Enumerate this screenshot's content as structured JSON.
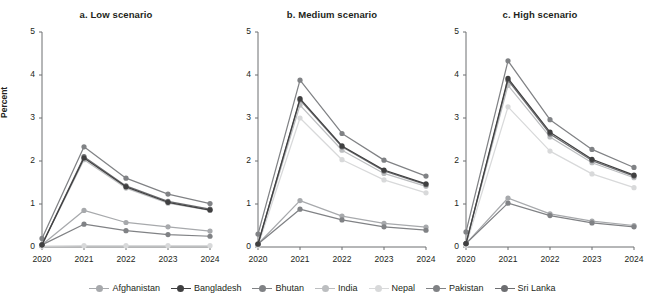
{
  "figure": {
    "ylabel": "Percent",
    "legend_position": "bottom"
  },
  "chart_data": {
    "type": "line",
    "title": "",
    "xlabel": "",
    "ylabel": "Percent",
    "x": [
      "2020",
      "2021",
      "2022",
      "2023",
      "2024"
    ],
    "ylim": [
      0,
      5
    ],
    "yticks": [
      0,
      1,
      2,
      3,
      4,
      5
    ],
    "grid": false,
    "legend": [
      "Afghanistan",
      "Bangladesh",
      "Bhutan",
      "India",
      "Nepal",
      "Pakistan",
      "Sri Lanka"
    ],
    "colors": {
      "Afghanistan": "#a7a9ac",
      "Bangladesh": "#404041",
      "Bhutan": "#808285",
      "India": "#bcbec0",
      "Nepal": "#d8d9da",
      "Pakistan": "#808285",
      "Sri Lanka": "#6d6e71"
    },
    "panels": [
      {
        "key": "low",
        "title": "a. Low scenario",
        "series": [
          {
            "name": "Afghanistan",
            "values": [
              0.05,
              0.85,
              0.57,
              0.47,
              0.37
            ]
          },
          {
            "name": "Bangladesh",
            "values": [
              0.05,
              2.07,
              1.4,
              1.04,
              0.86
            ]
          },
          {
            "name": "Bhutan",
            "values": [
              0.2,
              2.33,
              1.6,
              1.23,
              1.01
            ]
          },
          {
            "name": "India",
            "values": [
              0.05,
              2.03,
              1.37,
              1.02,
              0.85
            ]
          },
          {
            "name": "Nepal",
            "values": [
              0.02,
              0.03,
              0.03,
              0.03,
              0.03
            ]
          },
          {
            "name": "Pakistan",
            "values": [
              0.05,
              0.53,
              0.38,
              0.29,
              0.25
            ]
          },
          {
            "name": "Sri Lanka",
            "values": [
              0.05,
              2.1,
              1.42,
              1.06,
              0.88
            ]
          }
        ]
      },
      {
        "key": "medium",
        "title": "b. Medium scenario",
        "series": [
          {
            "name": "Afghanistan",
            "values": [
              0.07,
              1.08,
              0.72,
              0.55,
              0.46
            ]
          },
          {
            "name": "Bangladesh",
            "values": [
              0.07,
              3.45,
              2.35,
              1.79,
              1.47
            ]
          },
          {
            "name": "Bhutan",
            "values": [
              0.3,
              3.88,
              2.64,
              2.02,
              1.65
            ]
          },
          {
            "name": "India",
            "values": [
              0.07,
              3.3,
              2.25,
              1.71,
              1.41
            ]
          },
          {
            "name": "Nepal",
            "values": [
              0.03,
              3.0,
              2.03,
              1.56,
              1.26
            ]
          },
          {
            "name": "Pakistan",
            "values": [
              0.07,
              0.88,
              0.63,
              0.47,
              0.39
            ]
          },
          {
            "name": "Sri Lanka",
            "values": [
              0.07,
              3.42,
              2.33,
              1.77,
              1.45
            ]
          }
        ]
      },
      {
        "key": "high",
        "title": "c. High scenario",
        "series": [
          {
            "name": "Afghanistan",
            "values": [
              0.08,
              1.14,
              0.77,
              0.6,
              0.5
            ]
          },
          {
            "name": "Bangladesh",
            "values": [
              0.08,
              3.92,
              2.67,
              2.04,
              1.67
            ]
          },
          {
            "name": "Bhutan",
            "values": [
              0.35,
              4.33,
              2.96,
              2.27,
              1.85
            ]
          },
          {
            "name": "India",
            "values": [
              0.08,
              3.76,
              2.56,
              1.96,
              1.61
            ]
          },
          {
            "name": "Nepal",
            "values": [
              0.04,
              3.26,
              2.23,
              1.7,
              1.38
            ]
          },
          {
            "name": "Pakistan",
            "values": [
              0.08,
              1.02,
              0.73,
              0.56,
              0.47
            ]
          },
          {
            "name": "Sri Lanka",
            "values": [
              0.08,
              3.88,
              2.63,
              2.01,
              1.65
            ]
          }
        ]
      }
    ]
  }
}
